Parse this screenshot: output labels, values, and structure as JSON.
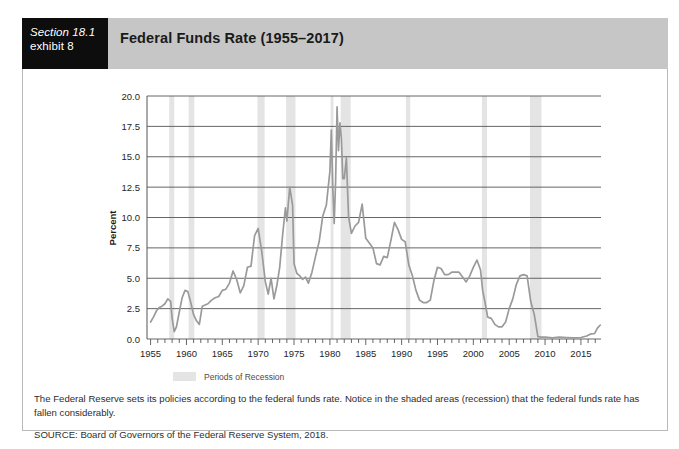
{
  "header": {
    "section_line1": "Section 18.1",
    "section_line2": "exhibit 8",
    "title": "Federal Funds Rate (1955–2017)"
  },
  "caption": {
    "main": "The Federal Reserve sets its policies according to the federal funds rate. Notice in the shaded areas (recession) that the federal funds rate has fallen considerably.",
    "source": "SOURCE: Board of Governors of the Federal Reserve System, 2018."
  },
  "legend": {
    "recession_label": "Periods of Recession"
  },
  "colors": {
    "line": "#9a9a9a",
    "recession_band": "#e4e4e4",
    "gridline": "#555555",
    "header_band": "#c6c6c6",
    "section_tab": "#0d0d0d",
    "frame_border": "#b9b9b9"
  },
  "chart_data": {
    "type": "line",
    "title": "Federal Funds Rate (1955–2017)",
    "xlabel": "",
    "ylabel": "Percent",
    "xlim": [
      1954.5,
      2017.8
    ],
    "ylim": [
      0.0,
      20.0
    ],
    "grid": true,
    "legend_position": "below-axis-center",
    "ytick_labels": [
      "0.0",
      "2.5",
      "5.0",
      "7.5",
      "10.0",
      "12.5",
      "15.0",
      "17.5",
      "20.0"
    ],
    "ytick_values": [
      0.0,
      2.5,
      5.0,
      7.5,
      10.0,
      12.5,
      15.0,
      17.5,
      20.0
    ],
    "xtick_labels": [
      "1955",
      "1960",
      "1965",
      "1970",
      "1975",
      "1980",
      "1985",
      "1990",
      "1995",
      "2000",
      "2005",
      "2010",
      "2015"
    ],
    "xtick_values": [
      1955,
      1960,
      1965,
      1970,
      1975,
      1980,
      1985,
      1990,
      1995,
      2000,
      2005,
      2010,
      2015
    ],
    "xminor_step": 1,
    "series": [
      {
        "name": "Federal Funds Rate",
        "x": [
          1955.0,
          1955.4,
          1955.8,
          1956.2,
          1956.6,
          1957.0,
          1957.4,
          1957.8,
          1958.0,
          1958.3,
          1958.6,
          1959.0,
          1959.4,
          1959.8,
          1960.2,
          1960.6,
          1961.0,
          1961.4,
          1961.8,
          1962.2,
          1962.6,
          1963.0,
          1963.5,
          1964.0,
          1964.5,
          1965.0,
          1965.5,
          1966.0,
          1966.5,
          1967.0,
          1967.5,
          1968.0,
          1968.5,
          1969.0,
          1969.5,
          1970.0,
          1970.5,
          1971.0,
          1971.4,
          1971.8,
          1972.2,
          1972.6,
          1973.0,
          1973.4,
          1973.8,
          1974.0,
          1974.4,
          1974.8,
          1975.0,
          1975.4,
          1975.8,
          1976.2,
          1976.6,
          1977.0,
          1977.5,
          1978.0,
          1978.5,
          1979.0,
          1979.5,
          1980.0,
          1980.2,
          1980.4,
          1980.6,
          1980.8,
          1981.0,
          1981.2,
          1981.4,
          1981.6,
          1981.8,
          1982.0,
          1982.3,
          1982.6,
          1983.0,
          1983.5,
          1984.0,
          1984.5,
          1985.0,
          1985.5,
          1986.0,
          1986.5,
          1987.0,
          1987.5,
          1988.0,
          1988.5,
          1989.0,
          1989.5,
          1990.0,
          1990.5,
          1991.0,
          1991.5,
          1992.0,
          1992.5,
          1993.0,
          1993.5,
          1994.0,
          1994.5,
          1995.0,
          1995.5,
          1996.0,
          1996.5,
          1997.0,
          1997.5,
          1998.0,
          1998.5,
          1999.0,
          1999.5,
          2000.0,
          2000.5,
          2001.0,
          2001.3,
          2001.6,
          2002.0,
          2002.5,
          2003.0,
          2003.5,
          2004.0,
          2004.5,
          2005.0,
          2005.5,
          2006.0,
          2006.5,
          2007.0,
          2007.5,
          2008.0,
          2008.5,
          2009.0,
          2009.5,
          2010.0,
          2011.0,
          2012.0,
          2013.0,
          2014.0,
          2015.0,
          2015.8,
          2016.3,
          2016.9,
          2017.3,
          2017.7
        ],
        "y": [
          1.4,
          1.8,
          2.3,
          2.6,
          2.7,
          2.9,
          3.3,
          3.1,
          1.7,
          0.6,
          1.0,
          2.2,
          3.4,
          4.0,
          3.9,
          3.0,
          2.0,
          1.5,
          1.2,
          2.7,
          2.8,
          2.9,
          3.2,
          3.4,
          3.5,
          4.0,
          4.1,
          4.6,
          5.6,
          4.9,
          3.8,
          4.4,
          5.9,
          6.0,
          8.5,
          9.1,
          7.2,
          4.7,
          3.7,
          5.0,
          3.3,
          4.4,
          5.9,
          8.5,
          10.8,
          9.7,
          12.5,
          11.0,
          6.2,
          5.4,
          5.2,
          4.9,
          5.1,
          4.6,
          5.5,
          6.8,
          8.0,
          10.1,
          11.0,
          13.8,
          17.2,
          12.5,
          9.5,
          13.0,
          19.1,
          15.5,
          17.8,
          16.5,
          13.2,
          13.2,
          14.9,
          10.1,
          8.7,
          9.3,
          9.6,
          11.1,
          8.3,
          7.9,
          7.5,
          6.2,
          6.1,
          6.8,
          6.7,
          8.1,
          9.6,
          9.0,
          8.2,
          8.0,
          6.1,
          5.2,
          4.0,
          3.2,
          3.0,
          3.0,
          3.2,
          4.8,
          5.9,
          5.8,
          5.3,
          5.3,
          5.5,
          5.5,
          5.5,
          5.1,
          4.7,
          5.2,
          5.9,
          6.5,
          5.7,
          4.0,
          3.1,
          1.8,
          1.7,
          1.2,
          1.0,
          1.0,
          1.4,
          2.5,
          3.3,
          4.5,
          5.2,
          5.3,
          5.2,
          3.1,
          2.0,
          0.2,
          0.15,
          0.15,
          0.1,
          0.15,
          0.12,
          0.1,
          0.12,
          0.25,
          0.4,
          0.45,
          0.9,
          1.15
        ]
      }
    ],
    "recession_bands": [
      {
        "start": 1957.6,
        "end": 1958.3
      },
      {
        "start": 1960.3,
        "end": 1961.1
      },
      {
        "start": 1969.9,
        "end": 1970.9
      },
      {
        "start": 1973.9,
        "end": 1975.2
      },
      {
        "start": 1980.1,
        "end": 1980.5
      },
      {
        "start": 1981.5,
        "end": 1982.9
      },
      {
        "start": 1990.6,
        "end": 1991.2
      },
      {
        "start": 2001.2,
        "end": 2001.9
      },
      {
        "start": 2007.9,
        "end": 2009.5
      }
    ]
  }
}
